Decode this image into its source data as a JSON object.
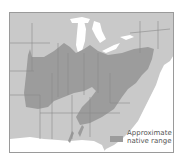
{
  "map": {
    "region": "Eastern United States",
    "colors": {
      "land": "#c9c9c9",
      "range": "#9c9c9c",
      "water": "#ffffff",
      "borders": "#8a8a8a"
    }
  },
  "legend": {
    "line1": "Approximate",
    "line2": "native range"
  }
}
